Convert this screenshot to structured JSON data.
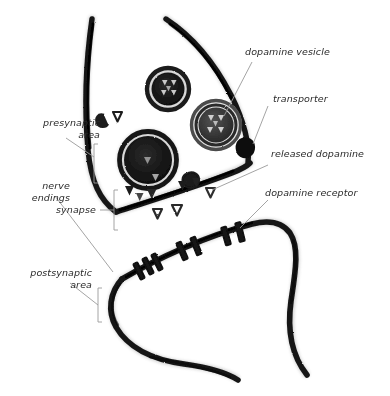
{
  "diagram": {
    "background_color": "#ffffff",
    "ink_color": "#1a1a1a",
    "leader_color": "#8a8a8a",
    "text_color": "#2a2a2a"
  },
  "labels": {
    "dopamine_vesicle": "dopamine vesicle",
    "transporter": "transporter",
    "released_dopamine": "released dopamine",
    "dopamine_receptor": "dopamine receptor",
    "presynaptic_area_l1": "presynaptic",
    "presynaptic_area_l2": "area",
    "nerve_endings_l1": "nerve",
    "nerve_endings_l2": "endings",
    "synapse": "synapse",
    "postsynaptic_area_l1": "postsynaptic",
    "postsynaptic_area_l2": "area"
  },
  "structures": {
    "vesicles": [
      {
        "name": "vesicle-small-upper-left",
        "cx": 168,
        "cy": 89,
        "r": 22
      },
      {
        "name": "vesicle-small-right",
        "cx": 216,
        "cy": 125,
        "r": 26
      },
      {
        "name": "vesicle-large-fusing",
        "cx": 148,
        "cy": 160,
        "r": 29
      }
    ],
    "transporter_count": 1,
    "receptor_count": 6,
    "released_dopamine_count": 9
  }
}
